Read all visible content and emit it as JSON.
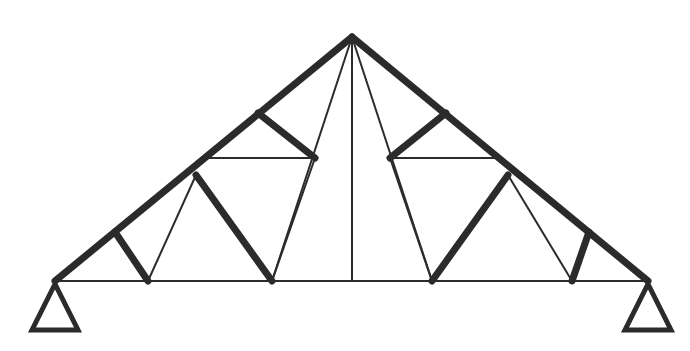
{
  "figure": {
    "type": "structural-truss-diagram",
    "width": 690,
    "height": 351,
    "background_color": "#ffffff",
    "ink_color": "#2b2b2b",
    "heavy_stroke_width": 7,
    "light_stroke_width": 2,
    "support_stroke_width": 5
  },
  "geometry": {
    "apex": {
      "x": 352,
      "y": 37
    },
    "left_bearing": {
      "x": 55,
      "y": 281
    },
    "right_bearing": {
      "x": 648,
      "y": 281
    },
    "bottom_chord_y": 281,
    "upper_tie_y": 158,
    "bottom_nodes_x": [
      148,
      272,
      432,
      572
    ],
    "rafter_nodes": {
      "left_lower": {
        "x": 115,
        "y": 232
      },
      "left_mid": {
        "x": 196,
        "y": 175
      },
      "left_upper": {
        "x": 258,
        "y": 113
      },
      "right_upper": {
        "x": 446,
        "y": 113
      },
      "right_mid": {
        "x": 508,
        "y": 175
      },
      "right_lower": {
        "x": 589,
        "y": 232
      }
    },
    "upper_tie_left": {
      "x1": 207,
      "x2": 315
    },
    "upper_tie_right": {
      "x1": 390,
      "x2": 497
    }
  },
  "members": {
    "top_chord_left": {
      "name": "Left rafter (top chord)",
      "weight": "heavy"
    },
    "top_chord_right": {
      "name": "Right rafter (top chord)",
      "weight": "heavy"
    },
    "bottom_chord": {
      "name": "Bottom chord (tie beam)",
      "weight": "light"
    },
    "king_post": {
      "name": "Centre king post",
      "weight": "light"
    },
    "upper_tie_left": {
      "name": "Left upper tie",
      "weight": "light"
    },
    "upper_tie_right": {
      "name": "Right upper tie",
      "weight": "light"
    },
    "strut_left_outer": {
      "name": "Left outer strut",
      "weight": "heavy"
    },
    "strut_left_inner": {
      "name": "Left inner strut",
      "weight": "heavy"
    },
    "strut_left_upper": {
      "name": "Left upper strut",
      "weight": "heavy"
    },
    "strut_right_upper": {
      "name": "Right upper strut",
      "weight": "heavy"
    },
    "strut_right_inner": {
      "name": "Right inner strut",
      "weight": "heavy"
    },
    "strut_right_outer": {
      "name": "Right outer strut",
      "weight": "heavy"
    },
    "diagonal_left_outer": {
      "name": "Left outer diagonal",
      "weight": "light"
    },
    "diagonal_left_mid": {
      "name": "Left mid diagonal",
      "weight": "light"
    },
    "diagonal_left_apex": {
      "name": "Left apex diagonal",
      "weight": "light"
    },
    "diagonal_right_apex": {
      "name": "Right apex diagonal",
      "weight": "light"
    },
    "diagonal_right_mid": {
      "name": "Right mid diagonal",
      "weight": "light"
    },
    "diagonal_right_outer": {
      "name": "Right outer diagonal",
      "weight": "light"
    }
  },
  "supports": {
    "left": {
      "name": "Left pin support",
      "apex": {
        "x": 55,
        "y": 284
      },
      "base_left": {
        "x": 32,
        "y": 330
      },
      "base_right": {
        "x": 78,
        "y": 330
      }
    },
    "right": {
      "name": "Right pin support",
      "apex": {
        "x": 648,
        "y": 284
      },
      "base_left": {
        "x": 625,
        "y": 330
      },
      "base_right": {
        "x": 671,
        "y": 330
      }
    }
  },
  "paths": {
    "top_chord_left": "M 55 281 L 352 37",
    "top_chord_right": "M 352 37 L 648 281",
    "bottom_chord": "M 55 281 L 648 281",
    "king_post": "M 352 37 L 352 281",
    "upper_tie_left": "M 207 158 L 315 158",
    "upper_tie_right": "M 390 158 L 497 158",
    "strut_left_outer": "M 115 232 L 148 281",
    "strut_left_inner": "M 196 175 L 272 281",
    "strut_left_upper": "M 258 113 L 315 158",
    "strut_right_upper": "M 446 113 L 390 158",
    "strut_right_inner": "M 508 175 L 432 281",
    "strut_right_outer": "M 589 232 L 572 281",
    "diagonal_left_outer": "M 148 281 L 196 175",
    "diagonal_left_mid": "M 272 281 L 315 158",
    "diagonal_left_apex": "M 272 281 L 352 37",
    "diagonal_right_apex": "M 432 281 L 352 37",
    "diagonal_right_mid": "M 432 281 L 390 158",
    "diagonal_right_outer": "M 572 281 L 508 175",
    "support_left": "M 55 284 L 32 330 L 78 330 Z",
    "support_right": "M 648 284 L 625 330 L 671 330 Z"
  }
}
